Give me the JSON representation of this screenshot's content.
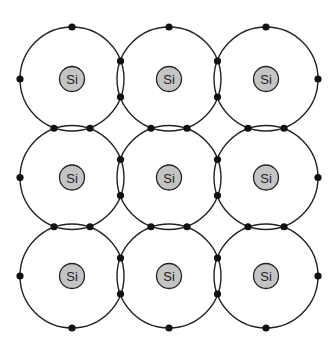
{
  "diagram": {
    "atom_label": "Si",
    "grid": {
      "rows": 3,
      "cols": 3,
      "x0": 72,
      "y0": 79,
      "dx": 97,
      "dy": 98.5,
      "shell_radius": 52,
      "nucleus_radius": 12.5
    },
    "atoms": [
      {
        "row": 0,
        "col": 0,
        "label": "Si"
      },
      {
        "row": 0,
        "col": 1,
        "label": "Si"
      },
      {
        "row": 0,
        "col": 2,
        "label": "Si"
      },
      {
        "row": 1,
        "col": 0,
        "label": "Si"
      },
      {
        "row": 1,
        "col": 1,
        "label": "Si"
      },
      {
        "row": 1,
        "col": 2,
        "label": "Si"
      },
      {
        "row": 2,
        "col": 0,
        "label": "Si"
      },
      {
        "row": 2,
        "col": 1,
        "label": "Si"
      },
      {
        "row": 2,
        "col": 2,
        "label": "Si"
      }
    ],
    "colors": {
      "nucleus_fill": "#c4c4c4",
      "stroke": "#222222",
      "electron": "#111111"
    }
  }
}
